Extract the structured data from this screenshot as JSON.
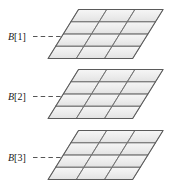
{
  "figure": {
    "background_color": "#ffffff",
    "width": 171,
    "height": 193,
    "grid": {
      "columns": 3,
      "rows": 4,
      "cell_fill_color": "#ededed",
      "cell_fill_color_light": "#f7f7f7",
      "cell_stroke_color": "#8a8a8a",
      "outline_color": "#5a5a5a",
      "gridline_color": "#6e6e6e"
    },
    "leader_line": {
      "color": "#555555",
      "style": "dashed",
      "dash_count": 4
    },
    "layers": [
      {
        "id": "layer-1",
        "label": "B[1]",
        "label_var": "B",
        "label_index": "[1]",
        "label_x": 8,
        "label_y": 40,
        "origin_x": 78.5,
        "origin_y": 9.5,
        "leader_x1": 33,
        "leader_x2": 63,
        "leader_y": 36.5
      },
      {
        "id": "layer-2",
        "label": "B[2]",
        "label_var": "B",
        "label_index": "[2]",
        "label_x": 8,
        "label_y": 100,
        "origin_x": 78.5,
        "origin_y": 69.5,
        "leader_x1": 33,
        "leader_x2": 63,
        "leader_y": 96.5
      },
      {
        "id": "layer-3",
        "label": "B[3]",
        "label_var": "B",
        "label_index": "[3]",
        "label_x": 8,
        "label_y": 161,
        "origin_x": 78.5,
        "origin_y": 130.5,
        "leader_x1": 33,
        "leader_x2": 63,
        "leader_y": 157.5
      }
    ],
    "geometry": {
      "cell_u_x": 28.2,
      "cell_u_y": 0,
      "cell_v_x": -7.6,
      "cell_v_y": 12.25
    }
  }
}
